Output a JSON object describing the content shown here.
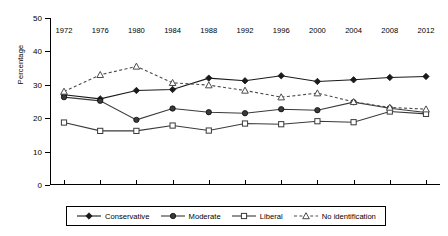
{
  "chart_data": {
    "type": "line",
    "title": "",
    "xlabel": "",
    "ylabel": "Percentage",
    "grid": false,
    "legend_position": "bottom",
    "xlim": [
      1972,
      2012
    ],
    "ylim": [
      0,
      50
    ],
    "ytick_labels": [
      "0",
      "10",
      "20",
      "30",
      "40",
      "50"
    ],
    "ytick_values": [
      0,
      10,
      20,
      30,
      40,
      50
    ],
    "categories": [
      1972,
      1976,
      1980,
      1984,
      1988,
      1992,
      1996,
      2000,
      2004,
      2008,
      2012
    ],
    "xtick_labels": [
      "1972",
      "1976",
      "1980",
      "1984",
      "1988",
      "1992",
      "1996",
      "2000",
      "2004",
      "2008",
      "2012"
    ],
    "series": [
      {
        "name": "Conservative",
        "marker": "filled-diamond",
        "line_style": "solid",
        "color": "#1a1a1a",
        "values": [
          27.0,
          25.8,
          28.3,
          28.6,
          32.0,
          31.2,
          32.7,
          31.0,
          31.5,
          32.2,
          32.5
        ]
      },
      {
        "name": "Moderate",
        "marker": "filled-circle",
        "line_style": "solid",
        "color": "#3a3a3a",
        "values": [
          26.3,
          25.2,
          19.5,
          22.9,
          21.8,
          21.5,
          22.7,
          22.4,
          24.8,
          23.0,
          21.7
        ]
      },
      {
        "name": "Liberal",
        "marker": "open-square",
        "line_style": "solid",
        "color": "#3a3a3a",
        "values": [
          18.7,
          16.2,
          16.2,
          17.8,
          16.3,
          18.4,
          18.2,
          19.1,
          18.8,
          22.0,
          21.3
        ]
      },
      {
        "name": "No identification",
        "marker": "open-triangle",
        "line_style": "dashed",
        "color": "#4a4a4a",
        "values": [
          28.0,
          33.0,
          35.5,
          30.6,
          29.9,
          28.3,
          26.3,
          27.5,
          24.9,
          23.2,
          22.7
        ]
      }
    ]
  },
  "legend": {
    "items": [
      {
        "label": "Conservative"
      },
      {
        "label": "Moderate"
      },
      {
        "label": "Liberal"
      },
      {
        "label": "No identification"
      }
    ]
  }
}
